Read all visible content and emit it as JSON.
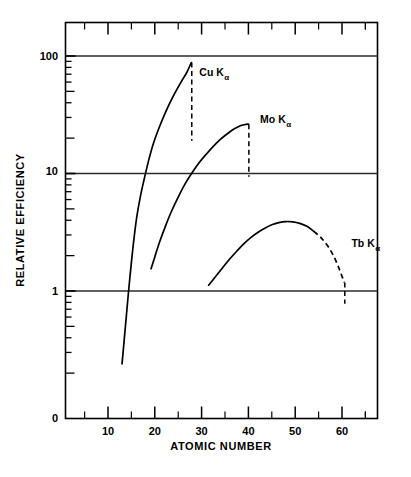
{
  "chart_data": {
    "type": "line",
    "title": "",
    "xlabel": "ATOMIC NUMBER",
    "ylabel": "RELATIVE EFFICIENCY",
    "yscale": "log",
    "xlim": [
      2,
      70
    ],
    "ylim": [
      0.18,
      180
    ],
    "grid": true,
    "grid_lines_y": [
      1,
      10,
      100
    ],
    "legend": "inline-annotations",
    "y_tick_labels": [
      "100",
      "10",
      "1",
      "0"
    ],
    "y_tick_values": [
      100,
      10,
      1,
      0
    ],
    "x_tick_labels": [
      "10",
      "20",
      "30",
      "40",
      "50",
      "60"
    ],
    "x_tick_values": [
      10,
      20,
      30,
      40,
      50,
      60
    ],
    "x_minor_tick_values": [
      5,
      15,
      25,
      35,
      45,
      55,
      65
    ],
    "series": [
      {
        "name": "Cu K",
        "subscript": "α",
        "label_x": 29.5,
        "label_y": 68,
        "points": [
          [
            13.0,
            0.24
          ],
          [
            13.4,
            0.36
          ],
          [
            13.9,
            0.6
          ],
          [
            14.4,
            1.0
          ],
          [
            15.0,
            1.75
          ],
          [
            15.6,
            2.9
          ],
          [
            16.2,
            4.4
          ],
          [
            17.0,
            6.6
          ],
          [
            17.8,
            9.2
          ],
          [
            18.7,
            13.0
          ],
          [
            19.7,
            18.0
          ],
          [
            21.0,
            25.0
          ],
          [
            22.4,
            34.0
          ],
          [
            24.0,
            46.0
          ],
          [
            25.6,
            60.0
          ],
          [
            26.8,
            72.0
          ],
          [
            27.8,
            88.0
          ]
        ],
        "drop_line": {
          "x": 27.9,
          "y_top": 88.0,
          "y_bottom": 19.0
        }
      },
      {
        "name": "Mo K",
        "subscript": "α",
        "label_x": 42.5,
        "label_y": 27.0,
        "points": [
          [
            19.2,
            1.55
          ],
          [
            20.0,
            1.95
          ],
          [
            21.0,
            2.6
          ],
          [
            22.2,
            3.5
          ],
          [
            23.5,
            4.7
          ],
          [
            25.0,
            6.3
          ],
          [
            26.5,
            8.2
          ],
          [
            28.0,
            10.2
          ],
          [
            29.5,
            12.4
          ],
          [
            31.0,
            14.6
          ],
          [
            32.5,
            17.0
          ],
          [
            34.0,
            19.5
          ],
          [
            35.5,
            21.8
          ],
          [
            37.0,
            24.0
          ],
          [
            38.4,
            25.6
          ],
          [
            39.5,
            26.2
          ],
          [
            40.0,
            26.3
          ]
        ],
        "drop_line": {
          "x": 40.1,
          "y_top": 26.3,
          "y_bottom": 9.4
        }
      },
      {
        "name": "Tb K",
        "subscript": "α",
        "label_x": 62.0,
        "label_y": 2.35,
        "points": [
          [
            31.5,
            1.12
          ],
          [
            33.0,
            1.33
          ],
          [
            34.5,
            1.58
          ],
          [
            36.0,
            1.87
          ],
          [
            37.5,
            2.18
          ],
          [
            39.0,
            2.52
          ],
          [
            40.5,
            2.85
          ],
          [
            42.0,
            3.15
          ],
          [
            43.5,
            3.42
          ],
          [
            45.0,
            3.66
          ],
          [
            46.5,
            3.82
          ],
          [
            48.0,
            3.9
          ],
          [
            49.5,
            3.88
          ],
          [
            51.0,
            3.76
          ],
          [
            52.5,
            3.55
          ],
          [
            54.0,
            3.22
          ]
        ],
        "dashed_tail": [
          [
            54.0,
            3.22
          ],
          [
            55.5,
            2.85
          ],
          [
            57.0,
            2.4
          ],
          [
            58.3,
            1.95
          ],
          [
            59.3,
            1.58
          ],
          [
            60.1,
            1.3
          ],
          [
            60.5,
            1.18
          ]
        ],
        "drop_line": {
          "x": 60.6,
          "y_top": 1.18,
          "y_bottom": 0.78
        }
      }
    ]
  },
  "axes": {
    "x_title": "ATOMIC NUMBER",
    "y_title": "RELATIVE EFFICIENCY",
    "y_labels": {
      "hundred": "100",
      "ten": "10",
      "one": "1",
      "zero": "0"
    },
    "x_labels": {
      "t10": "10",
      "t20": "20",
      "t30": "30",
      "t40": "40",
      "t50": "50",
      "t60": "60"
    }
  },
  "annotations": {
    "cu": {
      "main": "Cu K",
      "sub": "α"
    },
    "mo": {
      "main": "Mo K",
      "sub": "α"
    },
    "tb": {
      "main": "Tb K",
      "sub": "α"
    }
  },
  "colors": {
    "ink": "#000000",
    "background": "#ffffff",
    "grid": "#2b2b2b"
  }
}
